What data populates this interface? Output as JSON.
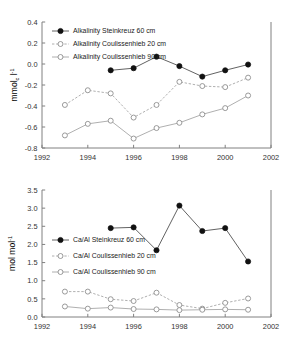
{
  "figure": {
    "name": "alkalinity-and-ca-al-time-series",
    "background_color": "#ffffff",
    "marker_dark_color": "#111111",
    "marker_open_color": "#8e8e8e",
    "axis_color": "#808080"
  },
  "chart_data": [
    {
      "type": "line",
      "id": "alkalinity",
      "title": "",
      "xlabel": "",
      "ylabel": "mmol c l-1",
      "ylabel_parts": {
        "base1": "mmol",
        "sub": "c",
        "base2": " l",
        "sup": "-1"
      },
      "xlim": [
        1992,
        2002
      ],
      "ylim": [
        -0.8,
        0.4
      ],
      "xticks": [
        1992,
        1994,
        1996,
        1998,
        2000,
        2002
      ],
      "xticklabels": [
        "1992",
        "1994",
        "1996",
        "1998",
        "2000",
        "2002"
      ],
      "yticks": [
        -0.8,
        -0.6,
        -0.4,
        -0.2,
        0.0,
        0.2,
        0.4
      ],
      "yticklabels": [
        "-0.8",
        "-0.6",
        "-0.4",
        "-0.2",
        "0.0",
        "0.2",
        "0.4"
      ],
      "grid": false,
      "legend_position": "upper-left",
      "series": [
        {
          "name": "Alkalinity Steinkreuz 60 cm",
          "marker": "filled-circle",
          "linestyle": "solid",
          "color": "#111111",
          "x": [
            1995,
            1996,
            1997,
            1998,
            1999,
            2000,
            2001
          ],
          "values": [
            -0.06,
            -0.04,
            0.07,
            -0.02,
            -0.12,
            -0.06,
            -0.005
          ]
        },
        {
          "name": "Alkalinity Coulissenhieb 20 cm",
          "marker": "open-circle",
          "linestyle": "dashed",
          "color": "#9a9a9a",
          "x": [
            1993,
            1994,
            1995,
            1996,
            1997,
            1998,
            1999,
            2000,
            2001
          ],
          "values": [
            -0.39,
            -0.25,
            -0.28,
            -0.51,
            -0.39,
            -0.17,
            -0.21,
            -0.22,
            -0.13
          ]
        },
        {
          "name": "Alkalinity Coulissenhieb 90 cm",
          "marker": "open-circle",
          "linestyle": "solid",
          "color": "#9a9a9a",
          "x": [
            1993,
            1994,
            1995,
            1996,
            1997,
            1998,
            1999,
            2000,
            2001
          ],
          "values": [
            -0.68,
            -0.57,
            -0.54,
            -0.71,
            -0.61,
            -0.56,
            -0.48,
            -0.42,
            -0.3
          ]
        }
      ]
    },
    {
      "type": "line",
      "id": "ca-al",
      "title": "",
      "xlabel": "",
      "ylabel": "mol mol-1",
      "ylabel_parts": {
        "base1": "mol mol",
        "sub": "",
        "base2": "",
        "sup": "-1"
      },
      "xlim": [
        1992,
        2002
      ],
      "ylim": [
        0.0,
        3.5
      ],
      "xticks": [
        1992,
        1994,
        1996,
        1998,
        2000,
        2002
      ],
      "xticklabels": [
        "1992",
        "1994",
        "1996",
        "1998",
        "2000",
        "2002"
      ],
      "yticks": [
        0.0,
        0.5,
        1.0,
        1.5,
        2.0,
        2.5,
        3.0,
        3.5
      ],
      "yticklabels": [
        "0.0",
        "0.5",
        "1.0",
        "1.5",
        "2.0",
        "2.5",
        "3.0",
        "3.5"
      ],
      "grid": false,
      "legend_position": "middle-left",
      "series": [
        {
          "name": "Ca/Al Steinkreuz 60 cm",
          "marker": "filled-circle",
          "linestyle": "solid",
          "color": "#111111",
          "x": [
            1995,
            1996,
            1997,
            1998,
            1999,
            2000,
            2001
          ],
          "values": [
            2.45,
            2.47,
            1.84,
            3.07,
            2.37,
            2.45,
            1.53
          ]
        },
        {
          "name": "Ca/Al Coulissenhieb 20 cm",
          "marker": "open-circle",
          "linestyle": "dashed",
          "color": "#9a9a9a",
          "x": [
            1993,
            1994,
            1995,
            1996,
            1997,
            1998,
            1999,
            2000,
            2001
          ],
          "values": [
            0.7,
            0.7,
            0.49,
            0.44,
            0.67,
            0.33,
            0.23,
            0.39,
            0.51
          ]
        },
        {
          "name": "Ca/Al Coulissenhieb 90 cm",
          "marker": "open-circle",
          "linestyle": "solid",
          "color": "#9a9a9a",
          "x": [
            1993,
            1994,
            1995,
            1996,
            1997,
            1998,
            1999,
            2000,
            2001
          ],
          "values": [
            0.29,
            0.23,
            0.26,
            0.22,
            0.21,
            0.19,
            0.2,
            0.21,
            0.2
          ]
        }
      ]
    }
  ]
}
